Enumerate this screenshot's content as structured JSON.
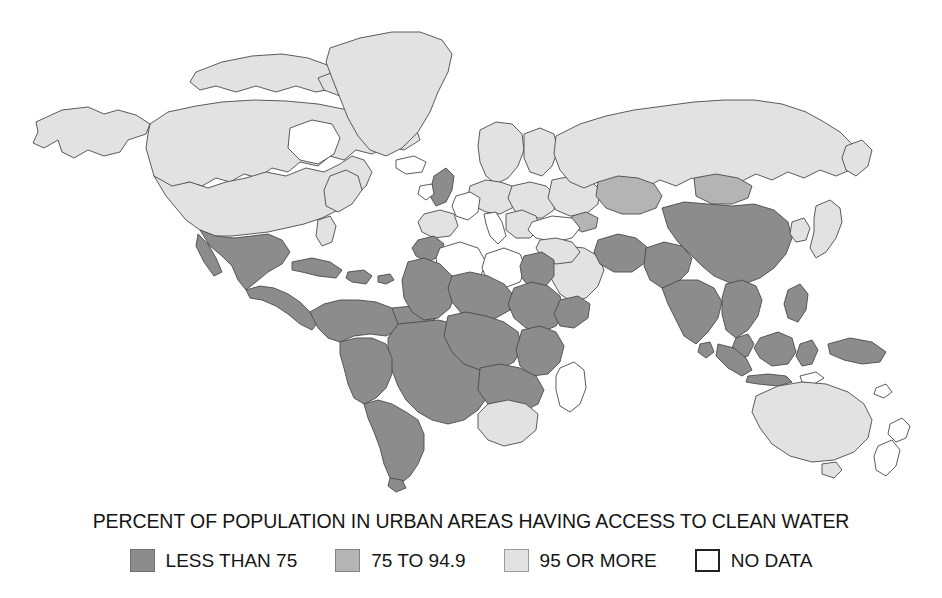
{
  "title": "PERCENT OF POPULATION IN URBAN AREAS HAVING ACCESS TO CLEAN WATER",
  "legend": {
    "items": [
      {
        "label": "LESS THAN 75",
        "key": "low",
        "color": "#8c8c8c"
      },
      {
        "label": "75 TO 94.9",
        "key": "mid",
        "color": "#b4b4b4"
      },
      {
        "label": "95 OR MORE",
        "key": "high",
        "color": "#e2e2e2"
      },
      {
        "label": "NO DATA",
        "key": "nodata",
        "color": "#ffffff"
      }
    ]
  },
  "map": {
    "projection": "world-equirectangular",
    "ocean_color": "#ffffff",
    "border_color": "#4a4a4a",
    "regions": [
      {
        "name": "Alaska",
        "category": "high"
      },
      {
        "name": "Canada",
        "category": "high"
      },
      {
        "name": "Greenland",
        "category": "high"
      },
      {
        "name": "United States",
        "category": "high"
      },
      {
        "name": "Mexico",
        "category": "low"
      },
      {
        "name": "Central America",
        "category": "low"
      },
      {
        "name": "Caribbean",
        "category": "low"
      },
      {
        "name": "Colombia and Venezuela",
        "category": "low"
      },
      {
        "name": "Brazil",
        "category": "low"
      },
      {
        "name": "Andean South America",
        "category": "low"
      },
      {
        "name": "Southern Cone",
        "category": "low"
      },
      {
        "name": "United Kingdom",
        "category": "low"
      },
      {
        "name": "Ireland",
        "category": "nodata"
      },
      {
        "name": "Iceland",
        "category": "nodata"
      },
      {
        "name": "Scandinavia",
        "category": "high"
      },
      {
        "name": "Western Europe",
        "category": "high"
      },
      {
        "name": "France",
        "category": "nodata"
      },
      {
        "name": "Iberia",
        "category": "high"
      },
      {
        "name": "Italy",
        "category": "nodata"
      },
      {
        "name": "Central Europe",
        "category": "high"
      },
      {
        "name": "Eastern Europe",
        "category": "high"
      },
      {
        "name": "Russia",
        "category": "high"
      },
      {
        "name": "Kazakhstan",
        "category": "mid"
      },
      {
        "name": "Mongolia",
        "category": "mid"
      },
      {
        "name": "Turkey",
        "category": "nodata"
      },
      {
        "name": "Arabian Peninsula",
        "category": "high"
      },
      {
        "name": "Iran",
        "category": "low"
      },
      {
        "name": "Afghanistan",
        "category": "low"
      },
      {
        "name": "Pakistan",
        "category": "low"
      },
      {
        "name": "India",
        "category": "low"
      },
      {
        "name": "China",
        "category": "low"
      },
      {
        "name": "Korea",
        "category": "high"
      },
      {
        "name": "Japan",
        "category": "high"
      },
      {
        "name": "Southeast Asia",
        "category": "low"
      },
      {
        "name": "Indonesia",
        "category": "low"
      },
      {
        "name": "Philippines",
        "category": "low"
      },
      {
        "name": "Papua New Guinea",
        "category": "low"
      },
      {
        "name": "Morocco",
        "category": "low"
      },
      {
        "name": "Algeria",
        "category": "nodata"
      },
      {
        "name": "Libya",
        "category": "nodata"
      },
      {
        "name": "Egypt",
        "category": "low"
      },
      {
        "name": "West Africa",
        "category": "low"
      },
      {
        "name": "Sahel",
        "category": "low"
      },
      {
        "name": "Horn of Africa",
        "category": "low"
      },
      {
        "name": "Central Africa",
        "category": "low"
      },
      {
        "name": "East Africa",
        "category": "low"
      },
      {
        "name": "Southern Africa",
        "category": "low"
      },
      {
        "name": "South Africa",
        "category": "high"
      },
      {
        "name": "Madagascar",
        "category": "nodata"
      },
      {
        "name": "Australia",
        "category": "high"
      },
      {
        "name": "New Zealand",
        "category": "nodata"
      }
    ]
  }
}
